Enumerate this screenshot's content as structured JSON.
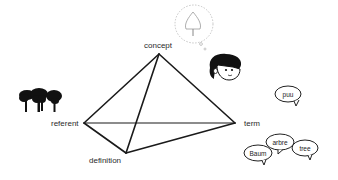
{
  "diagram": {
    "type": "semiotic-tetrahedron",
    "colors": {
      "line": "#1a1a1a",
      "text": "#2a2a2a",
      "bubble": "#222222",
      "thought": "#b8b8b8",
      "background": "#ffffff"
    },
    "vertices": {
      "concept": {
        "label": "concept",
        "x": 159,
        "y": 54
      },
      "referent": {
        "label": "referent",
        "x": 84,
        "y": 123
      },
      "term": {
        "label": "term",
        "x": 235,
        "y": 123
      },
      "definition": {
        "label": "definition",
        "x": 126,
        "y": 153
      }
    },
    "edges": [
      [
        "concept",
        "referent"
      ],
      [
        "concept",
        "term"
      ],
      [
        "concept",
        "definition"
      ],
      [
        "referent",
        "term"
      ],
      [
        "referent",
        "definition"
      ],
      [
        "definition",
        "term"
      ]
    ],
    "illustrations": {
      "referent": "trees-icon",
      "concept": "thought-bubble-tree-icon",
      "thinker": "person-face-icon"
    },
    "speech_bubbles": [
      {
        "word": "puu",
        "x": 279,
        "y": 85
      },
      {
        "word": "arbre",
        "x": 268,
        "y": 138
      },
      {
        "word": "tree",
        "x": 303,
        "y": 147
      },
      {
        "word": "Baum",
        "x": 255,
        "y": 152
      }
    ]
  }
}
